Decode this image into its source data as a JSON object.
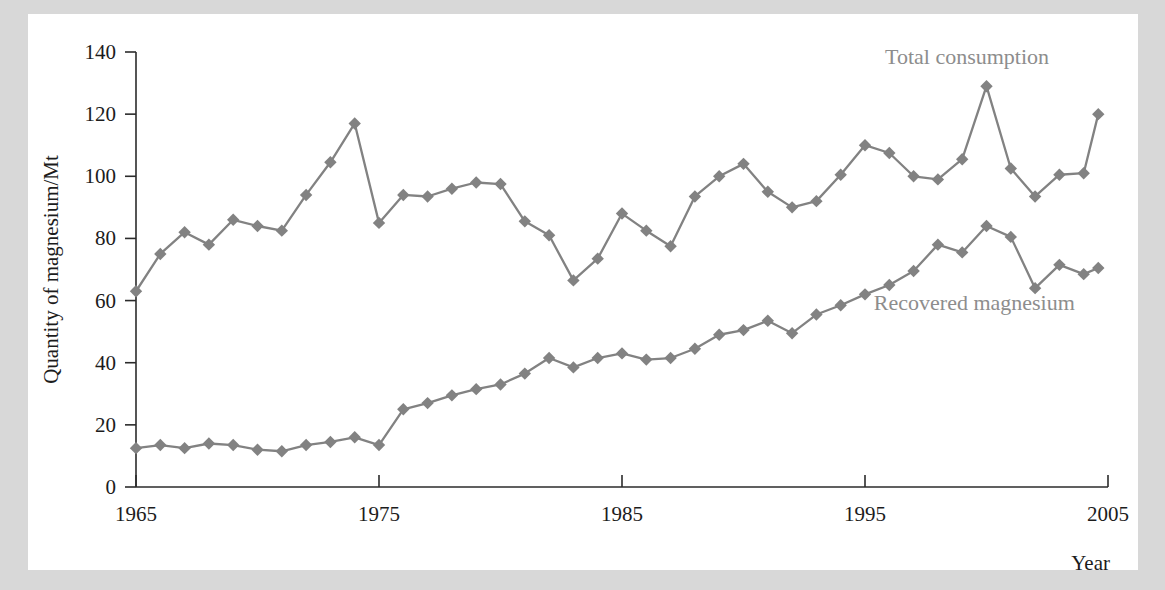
{
  "chart_data": {
    "type": "line",
    "title": "",
    "xlabel": "Year",
    "ylabel": "Quantity of magnesium/Mt",
    "xlim": [
      1965,
      2005
    ],
    "ylim": [
      0,
      140
    ],
    "xticks": [
      1965,
      1975,
      1985,
      1995,
      2005
    ],
    "yticks": [
      0,
      20,
      40,
      60,
      80,
      100,
      120,
      140
    ],
    "grid": false,
    "legend_position": "inline-annotations",
    "marker": "diamond",
    "series_color": "#828282",
    "axis_color": "#2b2b2b",
    "annotation_color": "#8d8d8d",
    "background_color": "#d8d8d8",
    "plot_background_color": "#ffffff",
    "series": [
      {
        "name": "Total consumption",
        "label_x": 1999.2,
        "label_y": 136,
        "x": [
          1965,
          1966,
          1967,
          1968,
          1969,
          1970,
          1971,
          1972,
          1973,
          1974,
          1975,
          1976,
          1977,
          1978,
          1979,
          1980,
          1981,
          1982,
          1983,
          1984,
          1985,
          1986,
          1987,
          1988,
          1989,
          1990,
          1991,
          1992,
          1993,
          1994,
          1995,
          1996,
          1997,
          1998,
          1999,
          2000,
          2001,
          2002,
          2003,
          2004
        ],
        "values": [
          63,
          75,
          82,
          78,
          86,
          84,
          82.5,
          94,
          104.5,
          117,
          85,
          94,
          93.5,
          96,
          98,
          97.5,
          85.5,
          81,
          66.5,
          73.5,
          88,
          82.5,
          77.5,
          93.5,
          100,
          104,
          95,
          90,
          92,
          100.5,
          110,
          107.5,
          100,
          99,
          105.5,
          129,
          102.5,
          93.5,
          100.5,
          101
        ]
      },
      {
        "name": "Recovered magnesium",
        "label_x": 1999.5,
        "label_y": 57,
        "x": [
          1965,
          1966,
          1967,
          1968,
          1969,
          1970,
          1971,
          1972,
          1973,
          1974,
          1975,
          1976,
          1977,
          1978,
          1979,
          1980,
          1981,
          1982,
          1983,
          1984,
          1985,
          1986,
          1987,
          1988,
          1989,
          1990,
          1991,
          1992,
          1993,
          1994,
          1995,
          1996,
          1997,
          1998,
          1999,
          2000,
          2001,
          2002,
          2003,
          2004
        ],
        "values": [
          12.5,
          13.5,
          12.5,
          14,
          13.5,
          12,
          11.5,
          13.5,
          14.5,
          16,
          13.5,
          25,
          27,
          29.5,
          31.5,
          33,
          36.5,
          41.5,
          38.5,
          41.5,
          43,
          41,
          41.5,
          44.5,
          49,
          50.5,
          53.5,
          49.5,
          55.5,
          58.5,
          62,
          65,
          69.5,
          78,
          75.5,
          84,
          80.5,
          64,
          71.5,
          68.5
        ]
      }
    ],
    "extra_points": [
      {
        "series": "Total consumption",
        "x": 2004.6,
        "y": 120
      },
      {
        "series": "Recovered magnesium",
        "x": 2004.6,
        "y": 70.5
      }
    ]
  }
}
